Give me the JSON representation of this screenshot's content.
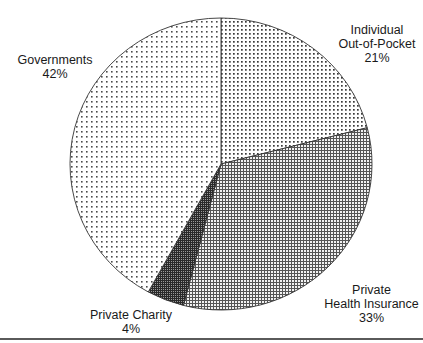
{
  "chart_data": {
    "type": "pie",
    "title": "",
    "start_angle_deg": 0,
    "direction": "clockwise",
    "center": [
      221,
      164
    ],
    "radius": [
      151,
      146
    ],
    "slices": [
      {
        "key": "individual",
        "label_lines": [
          "Individual",
          "Out-of-Pocket",
          "21%"
        ],
        "label": "Individual Out-of-Pocket",
        "value": 21,
        "pattern": "dots-medium"
      },
      {
        "key": "private_health",
        "label_lines": [
          "Private",
          "Health Insurance",
          "33%"
        ],
        "label": "Private Health Insurance",
        "value": 33,
        "pattern": "grid-fine"
      },
      {
        "key": "private_charity",
        "label_lines": [
          "Private Charity",
          "4%"
        ],
        "label": "Private Charity",
        "value": 4,
        "pattern": "grid-dark"
      },
      {
        "key": "governments",
        "label_lines": [
          "Governments",
          "42%"
        ],
        "label": "Governments",
        "value": 42,
        "pattern": "dots-sparse"
      }
    ],
    "legend": "none",
    "units": "%"
  },
  "labels": {
    "individual": {
      "line1": "Individual",
      "line2": "Out-of-Pocket",
      "pct": "21%"
    },
    "private_health": {
      "line1": "Private",
      "line2": "Health Insurance",
      "pct": "33%"
    },
    "private_charity": {
      "line1": "Private Charity",
      "pct": "4%"
    },
    "governments": {
      "line1": "Governments",
      "pct": "42%"
    }
  },
  "colors": {
    "outline": "#333333",
    "ink": "#1a1a1a",
    "background": "#ffffff",
    "rule": "#5a5a5a"
  }
}
